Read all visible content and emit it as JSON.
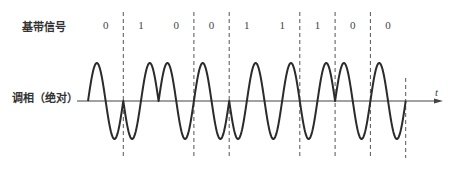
{
  "labels": {
    "baseband": "基带信号",
    "modulated": "调相（绝对）",
    "time_axis": "t"
  },
  "bits": [
    "0",
    "1",
    "0",
    "0",
    "1",
    "1",
    "1",
    "0",
    "0"
  ],
  "boundaries_shown_dashed": [
    1,
    3,
    4,
    6,
    7,
    8,
    9
  ],
  "layout": {
    "wave_start_x": 88,
    "symbol_width": 35.3,
    "axis_y": 101,
    "amplitude": 38,
    "axis_x_start": 77,
    "axis_x_end": 443,
    "bit_label_y": 19,
    "dash_top": 12,
    "dash_bottom": 158,
    "cycles_per_symbol": 1
  },
  "colors": {
    "wave": "#2b2b2b",
    "axis": "#444444",
    "dash": "#555555"
  },
  "notes": {
    "mapping": "0 → sin phase 0, 1 → phase π (inverted)"
  }
}
